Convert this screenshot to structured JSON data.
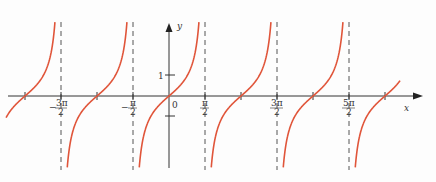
{
  "chart_data": {
    "type": "line",
    "title": "",
    "function": "y = tan x",
    "xlabel": "x",
    "ylabel": "y",
    "series": [
      {
        "name": "tan x",
        "color": "#e0553a"
      }
    ],
    "x_tick_labels": [
      "-3π/2",
      "-π/2",
      "π/2",
      "3π/2",
      "5π/2"
    ],
    "x_tick_values": [
      -4.712,
      -1.571,
      1.571,
      4.712,
      7.854
    ],
    "y_tick_labels": [
      "1"
    ],
    "origin_label": "0",
    "vertical_asymptotes": [
      "-3π/2",
      "-π/2",
      "π/2",
      "3π/2",
      "5π/2"
    ],
    "zero_crossings": [
      "-2π",
      "-π",
      "0",
      "π",
      "2π",
      "3π"
    ],
    "sample_points": [
      {
        "x": 0,
        "y": 0
      },
      {
        "x": 0.785,
        "y": 1
      },
      {
        "x": -0.785,
        "y": -1
      },
      {
        "x": 3.1416,
        "y": 0
      },
      {
        "x": 6.2832,
        "y": 0
      }
    ],
    "xlim": [
      -2.6,
      3.4
    ],
    "ylim": [
      -3.6,
      3.7
    ],
    "grid": false,
    "legend": "none",
    "colors": {
      "curve": "#e0553a",
      "axis": "#333333",
      "asymptote": "#555555"
    }
  },
  "labels": {
    "x_axis": "x",
    "y_axis": "y",
    "origin": "0",
    "y_tick_1": "1",
    "neg_3pi_over_2": {
      "sign": "−",
      "num": "3π",
      "den": "2"
    },
    "neg_pi_over_2": {
      "sign": "−",
      "num": "π",
      "den": "2"
    },
    "pi_over_2": {
      "num": "π",
      "den": "2"
    },
    "three_pi_over_2": {
      "num": "3π",
      "den": "2"
    },
    "five_pi_over_2": {
      "num": "5π",
      "den": "2"
    }
  }
}
